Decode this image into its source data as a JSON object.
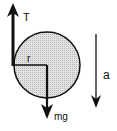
{
  "diagram": {
    "type": "free-body-diagram",
    "labels": {
      "tension": "T",
      "radius": "r",
      "weight": "mg",
      "acceleration": "a"
    },
    "colors": {
      "stroke": "#111111",
      "disk_fill": "#d4d4d4",
      "background": "#ffffff"
    },
    "disk": {
      "cx": 47,
      "cy": 65,
      "r": 33
    }
  }
}
